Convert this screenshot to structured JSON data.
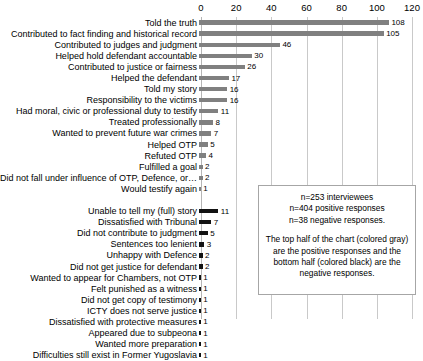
{
  "chart_data": {
    "type": "bar",
    "orientation": "horizontal",
    "title": "",
    "xlabel": "",
    "ylabel": "",
    "xlim": [
      0,
      120
    ],
    "xticks": [
      0,
      20,
      40,
      60,
      80,
      100,
      120
    ],
    "grid": true,
    "legend": "none",
    "series": [
      {
        "name": "positive responses",
        "color": "#808080",
        "categories": [
          "Told the truth",
          "Contributed to fact finding and historical record",
          "Contributed to judges and judgment",
          "Helped hold defendant accountable",
          "Contributed to justice or fairness",
          "Helped the defendant",
          "Told my story",
          "Responsibility to the victims",
          "Had moral, civic or professional duty to testify",
          "Treated professionally",
          "Wanted to prevent future war crimes",
          "Helped OTP",
          "Refuted OTP",
          "Fulfilled a goal",
          "Did not fall under influence of OTP, Defence, or…",
          "Would testify again"
        ],
        "values": [
          108,
          105,
          46,
          30,
          26,
          17,
          16,
          16,
          11,
          8,
          7,
          5,
          4,
          2,
          2,
          1
        ]
      },
      {
        "name": "negative responses",
        "color": "#121212",
        "categories": [
          "Unable to tell my (full) story",
          "Dissatisfied with Tribunal",
          "Did not contribute to judgment",
          "Sentences too lenient",
          "Unhappy with Defence",
          "Did not get justice for defendant",
          "Wanted to appear for Chambers, not OTP",
          "Felt punished as a witness",
          "Did not get copy of testimony",
          "ICTY does not serve justice",
          "Dissatisfied with protective measures",
          "Appeared due to subpeona",
          "Wanted more preparation",
          "Difficulties still exist in Former Yugoslavia"
        ],
        "values": [
          11,
          7,
          5,
          3,
          2,
          2,
          1,
          1,
          1,
          1,
          1,
          1,
          1,
          1
        ]
      }
    ],
    "annotations": {
      "note_line_1": "n=253 interviewees",
      "note_line_2": "n=404 positive responses",
      "note_line_3": "n=38 negative responses.",
      "note_paragraph": "The top half of the chart (colored gray) are the positive responses and the bottom half (colored black) are the negative responses."
    }
  },
  "axis": {
    "ticks": [
      {
        "label": "0",
        "value": 0
      },
      {
        "label": "20",
        "value": 20
      },
      {
        "label": "40",
        "value": 40
      },
      {
        "label": "60",
        "value": 60
      },
      {
        "label": "80",
        "value": 80
      },
      {
        "label": "100",
        "value": 100
      },
      {
        "label": "120",
        "value": 120
      }
    ]
  },
  "positive_rows": [
    {
      "label": "Told the truth",
      "value": "108",
      "n": 108
    },
    {
      "label": "Contributed to fact finding and historical record",
      "value": "105",
      "n": 105
    },
    {
      "label": "Contributed to judges and judgment",
      "value": "46",
      "n": 46
    },
    {
      "label": "Helped hold defendant accountable",
      "value": "30",
      "n": 30
    },
    {
      "label": "Contributed to justice or fairness",
      "value": "26",
      "n": 26
    },
    {
      "label": "Helped the defendant",
      "value": "17",
      "n": 17
    },
    {
      "label": "Told my story",
      "value": "16",
      "n": 16
    },
    {
      "label": "Responsibility to the victims",
      "value": "16",
      "n": 16
    },
    {
      "label": "Had moral, civic or professional duty to testify",
      "value": "11",
      "n": 11
    },
    {
      "label": "Treated professionally",
      "value": "8",
      "n": 8
    },
    {
      "label": "Wanted to prevent future war crimes",
      "value": "7",
      "n": 7
    },
    {
      "label": "Helped OTP",
      "value": "5",
      "n": 5
    },
    {
      "label": "Refuted OTP",
      "value": "4",
      "n": 4
    },
    {
      "label": "Fulfilled a goal",
      "value": "2",
      "n": 2
    },
    {
      "label": "Did not fall under influence of OTP, Defence, or…",
      "value": "2",
      "n": 2
    },
    {
      "label": "Would testify again",
      "value": "1",
      "n": 1
    }
  ],
  "negative_rows": [
    {
      "label": "Unable to tell my (full) story",
      "value": "11",
      "n": 11
    },
    {
      "label": "Dissatisfied with Tribunal",
      "value": "7",
      "n": 7
    },
    {
      "label": "Did not contribute to judgment",
      "value": "5",
      "n": 5
    },
    {
      "label": "Sentences too lenient",
      "value": "3",
      "n": 3
    },
    {
      "label": "Unhappy with Defence",
      "value": "2",
      "n": 2
    },
    {
      "label": "Did not get justice for defendant",
      "value": "2",
      "n": 2
    },
    {
      "label": "Wanted to appear for Chambers, not OTP",
      "value": "1",
      "n": 1
    },
    {
      "label": "Felt punished as a witness",
      "value": "1",
      "n": 1
    },
    {
      "label": "Did not get copy of testimony",
      "value": "1",
      "n": 1
    },
    {
      "label": "ICTY does not serve justice",
      "value": "1",
      "n": 1
    },
    {
      "label": "Dissatisfied with protective measures",
      "value": "1",
      "n": 1
    },
    {
      "label": "Appeared due to subpeona",
      "value": "1",
      "n": 1
    },
    {
      "label": "Wanted more preparation",
      "value": "1",
      "n": 1
    },
    {
      "label": "Difficulties still exist in Former Yugoslavia",
      "value": "1",
      "n": 1
    }
  ],
  "note": {
    "line1": "n=253 interviewees",
    "line2": "n=404 positive responses",
    "line3": "n=38 negative responses.",
    "paragraph": "The top half of the chart (colored gray) are the positive responses and the bottom half (colored black) are the negative responses."
  },
  "colors": {
    "positive_bar": "#808080",
    "negative_bar": "#121212",
    "gridline": "#c9c9c9",
    "note_border": "#a6a6a6"
  }
}
